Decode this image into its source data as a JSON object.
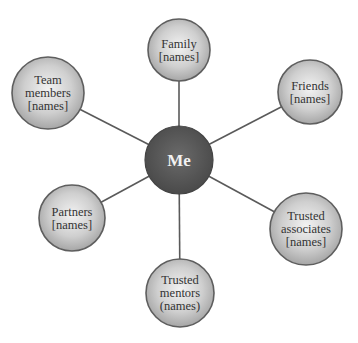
{
  "diagram": {
    "center": {
      "label": "Me",
      "x": 179,
      "y": 160,
      "r": 34
    },
    "nodes": [
      {
        "id": "family",
        "lines": [
          "Family",
          "[names]"
        ],
        "x": 179,
        "y": 50,
        "r": 31
      },
      {
        "id": "friends",
        "lines": [
          "Friends",
          "[names]"
        ],
        "x": 310,
        "y": 92,
        "r": 32
      },
      {
        "id": "trusted-associates",
        "lines": [
          "Trusted",
          "associates",
          "[names]"
        ],
        "x": 306,
        "y": 229,
        "r": 36
      },
      {
        "id": "trusted-mentors",
        "lines": [
          "Trusted",
          "mentors",
          "(names)"
        ],
        "x": 180,
        "y": 293,
        "r": 34
      },
      {
        "id": "partners",
        "lines": [
          "Partners",
          "[names]"
        ],
        "x": 72,
        "y": 218,
        "r": 33
      },
      {
        "id": "team-members",
        "lines": [
          "Team",
          "members",
          "[names]"
        ],
        "x": 48,
        "y": 93,
        "r": 36
      }
    ],
    "colors": {
      "center_fill": "#5a5a5a",
      "node_fill_light": "#efefef",
      "node_fill_dark": "#a8a8a8",
      "stroke": "#5e5e5e",
      "connector": "#5a5a5a"
    }
  }
}
